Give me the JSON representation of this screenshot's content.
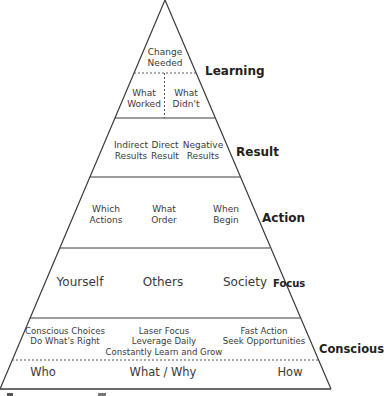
{
  "pyramid": {
    "colors": {
      "line": "#3a3a3a",
      "text": "#3a3a3a",
      "label": "#222222",
      "background": "#ffffff"
    },
    "layers": [
      {
        "label": "Learning",
        "rows": [
          {
            "items": [
              "Change\nNeeded"
            ]
          },
          {
            "items": [
              "What\nWorked",
              "What\nDidn't"
            ]
          }
        ]
      },
      {
        "label": "Result",
        "items": [
          "Indirect\nResults",
          "Direct\nResult",
          "Negative\nResults"
        ]
      },
      {
        "label": "Action",
        "items": [
          "Which\nActions",
          "What\nOrder",
          "When\nBegin"
        ]
      },
      {
        "label": "Focus",
        "items": [
          "Yourself",
          "Others",
          "Society"
        ]
      },
      {
        "label": "Conscious",
        "rows": [
          {
            "items": [
              "Conscious Choices\nDo What's Right",
              "Laser Focus\nLeverage Daily\nConstantly Learn and Grow",
              "Fast Action\nSeek Opportunities"
            ]
          },
          {
            "items": [
              "Who",
              "What / Why",
              "How"
            ]
          }
        ]
      }
    ]
  },
  "text": {
    "change1": "Change",
    "change2": "Needed",
    "worked1": "What",
    "worked2": "Worked",
    "didnt1": "What",
    "didnt2": "Didn't",
    "learning": "Learning",
    "ind1": "Indirect",
    "ind2": "Results",
    "dir1": "Direct",
    "dir2": "Result",
    "neg1": "Negative",
    "neg2": "Results",
    "result": "Result",
    "which1": "Which",
    "which2": "Actions",
    "order1": "What",
    "order2": "Order",
    "when1": "When",
    "when2": "Begin",
    "action": "Action",
    "yourself": "Yourself",
    "others": "Others",
    "society": "Society",
    "focus": "Focus",
    "cc1": "Conscious Choices",
    "cc2": "Do What's Right",
    "lf1": "Laser Focus",
    "lf2": "Leverage Daily",
    "lf3": "Constantly Learn and Grow",
    "fa1": "Fast Action",
    "fa2": "Seek Opportunities",
    "conscious": "Conscious",
    "who": "Who",
    "whatwhy": "What / Why",
    "how": "How"
  }
}
